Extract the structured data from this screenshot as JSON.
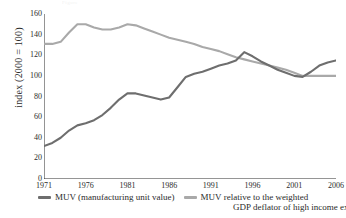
{
  "faint_header": "Figure",
  "axis": {
    "ylabel": "index (2000 = 100)",
    "yticks": [
      "160",
      "140",
      "120",
      "100",
      "80",
      "60",
      "40",
      "20",
      "0"
    ],
    "xticks": [
      "1971",
      "1976",
      "1981",
      "1986",
      "1991",
      "1996",
      "2001",
      "2006"
    ]
  },
  "legend": {
    "series1_label": "MUV (manufacturing unit value)",
    "series2_label": "MUV relative to the weighted",
    "series2_label_line2": "GDP deflator of high income exporters",
    "series1_color": "#6e6e6e",
    "series2_color": "#a9a9a9"
  },
  "chart_data": {
    "type": "line",
    "title": "",
    "xlabel": "",
    "ylabel": "index (2000 = 100)",
    "xlim": [
      1971,
      2006
    ],
    "ylim": [
      0,
      160
    ],
    "grid": false,
    "legend_position": "bottom",
    "x": [
      1971,
      1972,
      1973,
      1974,
      1975,
      1976,
      1977,
      1978,
      1979,
      1980,
      1981,
      1982,
      1983,
      1984,
      1985,
      1986,
      1987,
      1988,
      1989,
      1990,
      1991,
      1992,
      1993,
      1994,
      1995,
      1996,
      1997,
      1998,
      1999,
      2000,
      2001,
      2002,
      2003,
      2004,
      2005,
      2006
    ],
    "series": [
      {
        "name": "MUV (manufacturing unit value)",
        "color": "#6e6e6e",
        "values": [
          32,
          35,
          40,
          47,
          52,
          54,
          57,
          62,
          69,
          77,
          83,
          83,
          81,
          79,
          77,
          79,
          89,
          99,
          102,
          104,
          107,
          110,
          112,
          115,
          123,
          119,
          114,
          110,
          106,
          103,
          100,
          99,
          104,
          110,
          113,
          115
        ]
      },
      {
        "name": "MUV relative to the weighted GDP deflator of high income exporters",
        "color": "#a9a9a9",
        "values": [
          131,
          131,
          133,
          142,
          150,
          150,
          147,
          145,
          145,
          147,
          150,
          149,
          146,
          143,
          140,
          137,
          135,
          133,
          131,
          128,
          126,
          124,
          121,
          118,
          116,
          114,
          112,
          110,
          108,
          106,
          103,
          100,
          100,
          100,
          100,
          100
        ]
      }
    ]
  }
}
